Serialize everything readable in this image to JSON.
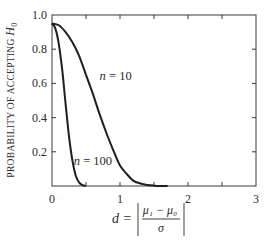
{
  "chart_data": {
    "type": "line",
    "title": "",
    "xlabel": "d = |(μ₁ − μ₀)/σ|",
    "xlabel_parts": {
      "lhs": "d =",
      "numerator": "μ₁ − μ₀",
      "denominator": "σ"
    },
    "ylabel": "PROBABILITY OF ACCEPTING H₀",
    "ylabel_parts": {
      "text": "PROBABILITY OF ACCEPTING ",
      "var": "H",
      "sub": "0"
    },
    "xlim": [
      0,
      3
    ],
    "ylim": [
      0,
      1
    ],
    "x_ticks": [
      0,
      0.5,
      1,
      1.5,
      2,
      2.5,
      3
    ],
    "x_tick_labels": [
      {
        "value": 0,
        "label": "0"
      },
      {
        "value": 1,
        "label": "1"
      },
      {
        "value": 2,
        "label": "2"
      },
      {
        "value": 3,
        "label": "3"
      }
    ],
    "y_ticks": [
      0,
      0.2,
      0.4,
      0.6,
      0.8,
      1.0
    ],
    "y_tick_labels": [
      {
        "value": 1.0,
        "label": "1.0"
      },
      {
        "value": 0.8,
        "label": "0.8"
      },
      {
        "value": 0.6,
        "label": "0.6"
      },
      {
        "value": 0.4,
        "label": "0.4"
      },
      {
        "value": 0.2,
        "label": "0.2"
      }
    ],
    "grid": false,
    "legend": "inline labels",
    "series": [
      {
        "name": "n = 10",
        "label_pos": {
          "x": 0.7,
          "y": 0.62
        },
        "x": [
          0,
          0.1,
          0.2,
          0.3,
          0.4,
          0.5,
          0.6,
          0.7,
          0.8,
          0.9,
          1.0,
          1.1,
          1.2,
          1.3,
          1.4,
          1.5,
          1.6,
          1.7
        ],
        "values": [
          0.95,
          0.94,
          0.9,
          0.84,
          0.76,
          0.65,
          0.54,
          0.42,
          0.31,
          0.21,
          0.12,
          0.07,
          0.03,
          0.015,
          0.006,
          0.002,
          0.0,
          0.0
        ]
      },
      {
        "name": "n = 100",
        "label_pos": {
          "x": 0.32,
          "y": 0.12
        },
        "x": [
          0,
          0.05,
          0.1,
          0.15,
          0.2,
          0.25,
          0.3,
          0.35,
          0.4,
          0.45,
          0.5
        ],
        "values": [
          0.95,
          0.92,
          0.83,
          0.68,
          0.48,
          0.29,
          0.15,
          0.06,
          0.02,
          0.005,
          0.0
        ]
      }
    ]
  }
}
